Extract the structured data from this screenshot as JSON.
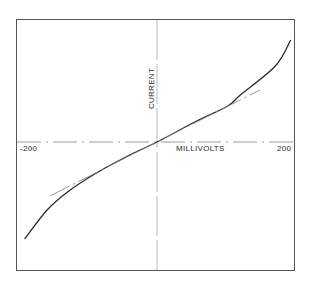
{
  "chart_data": {
    "type": "line",
    "title": "",
    "xlabel": "MILLIVOLTS",
    "ylabel": "CURRENT",
    "xlim": [
      -200,
      200
    ],
    "x_tick_labels": [
      "-200",
      "200"
    ],
    "grid": false,
    "legend": null,
    "axes_style": {
      "x_axis": "dash-dot through origin",
      "y_axis": "long-dash through origin",
      "frame": "box"
    },
    "series": [
      {
        "name": "current-voltage curve",
        "style": "solid",
        "x": [
          -189,
          -157,
          -124,
          -84,
          -39,
          0,
          54,
          101,
          119,
          169,
          191
        ],
        "y": [
          -97,
          -68,
          -48,
          -30,
          -13,
          0,
          20,
          36,
          47,
          76,
          102
        ]
      },
      {
        "name": "linear tangent at origin",
        "style": "dash-dot",
        "x": [
          -153,
          147
        ],
        "y": [
          -54,
          52
        ]
      }
    ],
    "y_units": "arbitrary (no tick labels shown)"
  },
  "labels": {
    "x_min": "-200",
    "x_max": "200",
    "x_axis": "MILLIVOLTS",
    "y_axis": "CURRENT"
  },
  "colors": {
    "curve": "#2b2b2b",
    "tangent": "#8a8a8a",
    "axes": "#9a9a9a",
    "frame": "#555555"
  }
}
